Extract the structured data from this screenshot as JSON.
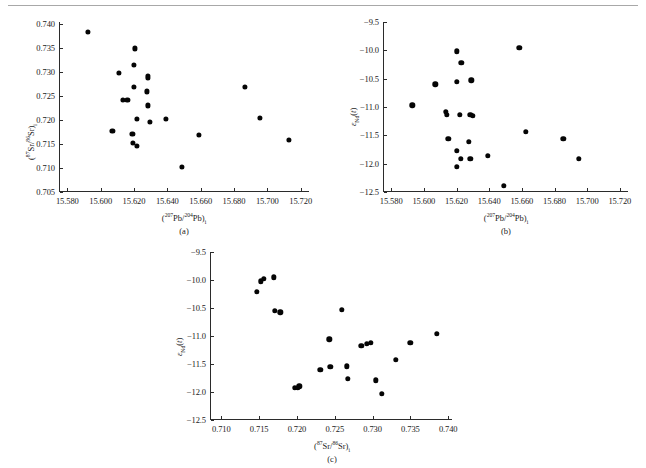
{
  "figure": {
    "background_color": "#ffffff",
    "marker_color": "#050505",
    "axis_color": "#2b2b2b",
    "panel_captions": [
      "(a)",
      "(b)",
      "(c)"
    ]
  },
  "chart_data": [
    {
      "type": "scatter",
      "panel": "(a)",
      "title": "",
      "xlabel": "(207Pb/204Pb)i",
      "ylabel": "(87Sr/86Sr)i",
      "xlabel_parts": {
        "pre": "(",
        "sup1": "207",
        "mid1": "Pb/",
        "sup2": "204",
        "mid2": "Pb)",
        "sub": "i"
      },
      "ylabel_parts": {
        "pre": "(",
        "sup1": "87",
        "mid1": "Sr/",
        "sup2": "86",
        "mid2": "Sr)",
        "sub": "i"
      },
      "xlim": [
        15.575,
        15.725
      ],
      "ylim": [
        0.705,
        0.7405
      ],
      "xticks": [
        15.58,
        15.6,
        15.62,
        15.64,
        15.66,
        15.68,
        15.7,
        15.72
      ],
      "xticklabels": [
        "15.580",
        "15.600",
        "15.620",
        "15.640",
        "15.660",
        "15.680",
        "15.700",
        "15.720"
      ],
      "yticks": [
        0.705,
        0.71,
        0.715,
        0.72,
        0.725,
        0.73,
        0.735,
        0.74
      ],
      "yticklabels": [
        "0.705",
        "0.710",
        "0.715",
        "0.720",
        "0.725",
        "0.730",
        "0.735",
        "0.740"
      ],
      "grid": false,
      "legend": "none",
      "points": [
        {
          "x": 15.5925,
          "y": 0.7385
        },
        {
          "x": 15.6205,
          "y": 0.735
        },
        {
          "x": 15.62,
          "y": 0.7315
        },
        {
          "x": 15.611,
          "y": 0.7298
        },
        {
          "x": 15.6285,
          "y": 0.7292
        },
        {
          "x": 15.6285,
          "y": 0.7288
        },
        {
          "x": 15.6865,
          "y": 0.7269
        },
        {
          "x": 15.62,
          "y": 0.727
        },
        {
          "x": 15.6275,
          "y": 0.726
        },
        {
          "x": 15.6135,
          "y": 0.7243
        },
        {
          "x": 15.616,
          "y": 0.7243
        },
        {
          "x": 15.6285,
          "y": 0.7231
        },
        {
          "x": 15.6955,
          "y": 0.7205
        },
        {
          "x": 15.6215,
          "y": 0.7203
        },
        {
          "x": 15.639,
          "y": 0.7202
        },
        {
          "x": 15.6295,
          "y": 0.7196
        },
        {
          "x": 15.607,
          "y": 0.7178
        },
        {
          "x": 15.713,
          "y": 0.7159
        },
        {
          "x": 15.659,
          "y": 0.7169
        },
        {
          "x": 15.619,
          "y": 0.7171
        },
        {
          "x": 15.6195,
          "y": 0.7152
        },
        {
          "x": 15.6215,
          "y": 0.7147
        },
        {
          "x": 15.6485,
          "y": 0.7102
        }
      ]
    },
    {
      "type": "scatter",
      "panel": "(b)",
      "title": "",
      "xlabel": "(207Pb/204Pb)i",
      "ylabel": "eNd(t)",
      "xlabel_parts": {
        "pre": "(",
        "sup1": "207",
        "mid1": "Pb/",
        "sup2": "204",
        "mid2": "Pb)",
        "sub": "i"
      },
      "ylabel_parts": {
        "eps": "ε",
        "sub": "Nd",
        "post": "(t)"
      },
      "xlim": [
        15.575,
        15.725
      ],
      "ylim": [
        -12.5,
        -9.5
      ],
      "xticks": [
        15.58,
        15.6,
        15.62,
        15.64,
        15.66,
        15.68,
        15.7,
        15.72
      ],
      "xticklabels": [
        "15.580",
        "15.600",
        "15.620",
        "15.640",
        "15.660",
        "15.680",
        "15.700",
        "15.720"
      ],
      "yticks": [
        -12.5,
        -12.0,
        -11.5,
        -11.0,
        -10.5,
        -10.0,
        -9.5
      ],
      "yticklabels": [
        "−12.5",
        "−12.0",
        "−11.5",
        "−11.0",
        "−10.5",
        "−10.0",
        "−9.5"
      ],
      "grid": false,
      "legend": "none",
      "points": [
        {
          "x": 15.6585,
          "y": -9.96
        },
        {
          "x": 15.62,
          "y": -10.02
        },
        {
          "x": 15.623,
          "y": -10.22
        },
        {
          "x": 15.62,
          "y": -10.55
        },
        {
          "x": 15.629,
          "y": -10.53
        },
        {
          "x": 15.607,
          "y": -10.6
        },
        {
          "x": 15.593,
          "y": -10.97
        },
        {
          "x": 15.6135,
          "y": -11.09
        },
        {
          "x": 15.614,
          "y": -11.14
        },
        {
          "x": 15.622,
          "y": -11.14
        },
        {
          "x": 15.6285,
          "y": -11.14
        },
        {
          "x": 15.63,
          "y": -11.16
        },
        {
          "x": 15.6625,
          "y": -11.44
        },
        {
          "x": 15.615,
          "y": -11.56
        },
        {
          "x": 15.6855,
          "y": -11.56
        },
        {
          "x": 15.6275,
          "y": -11.61
        },
        {
          "x": 15.62,
          "y": -11.77
        },
        {
          "x": 15.6225,
          "y": -11.91
        },
        {
          "x": 15.6285,
          "y": -11.91
        },
        {
          "x": 15.639,
          "y": -11.86
        },
        {
          "x": 15.695,
          "y": -11.91
        },
        {
          "x": 15.62,
          "y": -12.06
        },
        {
          "x": 15.649,
          "y": -12.39
        }
      ]
    },
    {
      "type": "scatter",
      "panel": "(c)",
      "title": "",
      "xlabel": "(87Sr/86Sr)i",
      "ylabel": "eNd(t)",
      "xlabel_parts": {
        "pre": "(",
        "sup1": "87",
        "mid1": "Sr/",
        "sup2": "86",
        "mid2": "Sr)",
        "sub": "i"
      },
      "ylabel_parts": {
        "eps": "ε",
        "sub": "Nd",
        "post": "(t)"
      },
      "xlim": [
        0.7085,
        0.7405
      ],
      "ylim": [
        -12.5,
        -9.5
      ],
      "xticks": [
        0.71,
        0.715,
        0.72,
        0.725,
        0.73,
        0.735,
        0.74
      ],
      "xticklabels": [
        "0.710",
        "0.715",
        "0.720",
        "0.725",
        "0.730",
        "0.735",
        "0.740"
      ],
      "yticks": [
        -12.5,
        -12.0,
        -11.5,
        -11.0,
        -10.5,
        -10.0,
        -9.5
      ],
      "yticklabels": [
        "−12.5",
        "−12.0",
        "−11.5",
        "−11.0",
        "−10.5",
        "−10.0",
        "−9.5"
      ],
      "grid": false,
      "legend": "none",
      "points": [
        {
          "x": 0.7152,
          "y": -10.02
        },
        {
          "x": 0.7156,
          "y": -9.98
        },
        {
          "x": 0.7169,
          "y": -9.95
        },
        {
          "x": 0.7147,
          "y": -10.21
        },
        {
          "x": 0.7171,
          "y": -10.55
        },
        {
          "x": 0.7178,
          "y": -10.58
        },
        {
          "x": 0.7259,
          "y": -10.53
        },
        {
          "x": 0.7243,
          "y": -11.06
        },
        {
          "x": 0.7385,
          "y": -10.96
        },
        {
          "x": 0.735,
          "y": -11.12
        },
        {
          "x": 0.7285,
          "y": -11.17
        },
        {
          "x": 0.7292,
          "y": -11.14
        },
        {
          "x": 0.7298,
          "y": -11.12
        },
        {
          "x": 0.7331,
          "y": -11.43
        },
        {
          "x": 0.7231,
          "y": -11.6
        },
        {
          "x": 0.7244,
          "y": -11.55
        },
        {
          "x": 0.7266,
          "y": -11.54
        },
        {
          "x": 0.7267,
          "y": -11.76
        },
        {
          "x": 0.7304,
          "y": -11.79
        },
        {
          "x": 0.7197,
          "y": -11.92
        },
        {
          "x": 0.7203,
          "y": -11.9
        },
        {
          "x": 0.7201,
          "y": -11.93
        },
        {
          "x": 0.7312,
          "y": -12.03
        }
      ]
    }
  ]
}
